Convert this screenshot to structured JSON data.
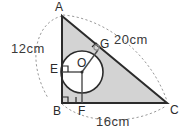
{
  "figure": {
    "kind": "geometry-diagram",
    "background_color": "#ffffff",
    "stroke_color": "#2b2b2b",
    "shade_color": "#d3d3d3",
    "dash_color": "#9a9a9a",
    "circle_fill": "#ffffff"
  },
  "vertices": [
    {
      "id": "A",
      "label": "A",
      "x": 62,
      "y": 16,
      "label_x": 55,
      "label_y": 1
    },
    {
      "id": "B",
      "label": "B",
      "x": 62,
      "y": 103,
      "label_x": 53,
      "label_y": 105
    },
    {
      "id": "C",
      "label": "C",
      "x": 167,
      "y": 103,
      "label_x": 170,
      "label_y": 104
    }
  ],
  "points": [
    {
      "id": "O",
      "label": "O",
      "x": 82,
      "y": 72,
      "label_x": 77,
      "label_y": 57
    },
    {
      "id": "E",
      "label": "E",
      "x": 62,
      "y": 72,
      "label_x": 50,
      "label_y": 63
    },
    {
      "id": "F",
      "label": "F",
      "x": 82,
      "y": 103,
      "label_x": 78,
      "label_y": 105
    },
    {
      "id": "G",
      "label": "G",
      "x": 98,
      "y": 50,
      "label_x": 100,
      "label_y": 38
    }
  ],
  "circle": {
    "cx": 82,
    "cy": 72,
    "r": 21
  },
  "measurements": [
    {
      "id": "AB",
      "label": "12cm",
      "side": "AB",
      "x": 11,
      "y": 42
    },
    {
      "id": "BC",
      "label": "16cm",
      "side": "BC",
      "x": 96,
      "y": 115
    },
    {
      "id": "AC",
      "label": "20cm",
      "side": "AC",
      "x": 114,
      "y": 33
    }
  ],
  "right_angles": [
    {
      "id": "angle-B",
      "at": "B"
    },
    {
      "id": "angle-E",
      "at": "E"
    },
    {
      "id": "angle-F",
      "at": "F"
    },
    {
      "id": "angle-G",
      "at": "G"
    }
  ]
}
